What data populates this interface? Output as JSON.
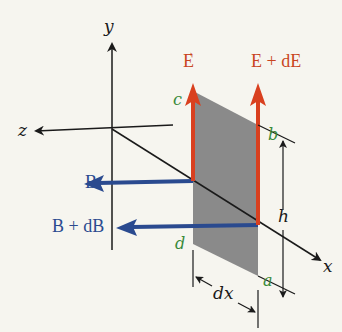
{
  "figure": {
    "axes": {
      "x_label": "x",
      "y_label": "y",
      "z_label": "z"
    },
    "vectors": {
      "E_label": "E",
      "E_plus_dE_label": "E + dE",
      "B_label": "B",
      "B_plus_dB_label": "B + dB"
    },
    "corners": {
      "a": "a",
      "b": "b",
      "c": "c",
      "d": "d"
    },
    "dimensions": {
      "height_label": "h",
      "width_label": "dx"
    },
    "colors": {
      "background": "#f6f5ef",
      "panel": "#8a8a8a",
      "electric_field": "#d9401f",
      "magnetic_field": "#2a4a8f",
      "corner_labels": "#3a8a3a",
      "axes": "#1a1a1a"
    }
  }
}
